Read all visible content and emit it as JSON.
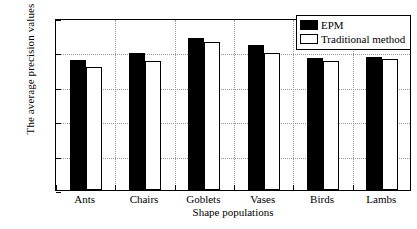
{
  "chart_data": {
    "type": "bar",
    "title": "",
    "xlabel": "Shape populations",
    "ylabel": "The average precision values",
    "categories": [
      "Ants",
      "Chairs",
      "Goblets",
      "Vases",
      "Birds",
      "Lambs"
    ],
    "series": [
      {
        "name": "EPM",
        "color": "#000000",
        "values": [
          0.755,
          0.795,
          0.885,
          0.845,
          0.765,
          0.775
        ]
      },
      {
        "name": "Traditional method",
        "color": "#ffffff",
        "values": [
          0.715,
          0.748,
          0.862,
          0.798,
          0.748,
          0.762
        ]
      }
    ],
    "ylim": [
      0,
      1
    ],
    "yticks": [
      "0",
      "0.2",
      "0.4",
      "0.6",
      "0.8",
      "1"
    ],
    "ytick_values": [
      0,
      0.2,
      0.4,
      0.6,
      0.8,
      1
    ],
    "grid": true,
    "grid_style": "dotted",
    "legend_position": "upper-right"
  },
  "legend": {
    "entries": [
      {
        "label": "EPM"
      },
      {
        "label": "Traditional method"
      }
    ]
  }
}
